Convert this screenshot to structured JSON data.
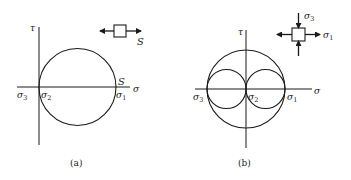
{
  "panels": [
    {
      "id": "a",
      "caption": "(a)",
      "axes": {
        "x_label": "σ",
        "y_label": "τ"
      },
      "points": [
        {
          "symbol": "σ",
          "sub": "3"
        },
        {
          "symbol": "σ",
          "sub": "2"
        },
        {
          "symbol": "σ",
          "sub": "1"
        }
      ],
      "point_marker": "S",
      "element": {
        "type": "uniaxial-tension",
        "label": "S"
      }
    },
    {
      "id": "b",
      "caption": "(b)",
      "axes": {
        "x_label": "σ",
        "y_label": "τ"
      },
      "points": [
        {
          "symbol": "σ",
          "sub": "3"
        },
        {
          "symbol": "σ",
          "sub": "2"
        },
        {
          "symbol": "σ",
          "sub": "1"
        }
      ],
      "element": {
        "type": "biaxial-tension-compression",
        "vertical_label": {
          "symbol": "σ",
          "sub": "3"
        },
        "horizontal_label": {
          "symbol": "σ",
          "sub": "1"
        }
      }
    }
  ],
  "colors": {
    "stroke": "#1a1a1a",
    "background": "#ffffff"
  }
}
